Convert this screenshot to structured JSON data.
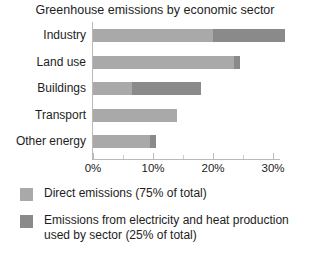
{
  "chart_data": {
    "type": "bar",
    "orientation": "horizontal",
    "stacked": true,
    "title": "Greenhouse emissions by economic sector",
    "xlabel": "",
    "ylabel": "",
    "xlim": [
      0,
      33
    ],
    "grid": false,
    "legend_position": "bottom-left",
    "categories": [
      "Industry",
      "Land use",
      "Buildings",
      "Transport",
      "Other energy"
    ],
    "tick_labels": [
      "0%",
      "10%",
      "20%",
      "30%"
    ],
    "tick_values": [
      0,
      10,
      20,
      30
    ],
    "minor_tick_values": [
      5,
      15,
      25
    ],
    "series": [
      {
        "name": "Direct emissions (75% of total)",
        "color": "#a9a9a9",
        "values": [
          20.0,
          23.5,
          6.5,
          14.0,
          9.5
        ]
      },
      {
        "name": "Emissions from electricity and heat production used by sector (25% of total)",
        "color": "#8a8a8a",
        "values": [
          12.0,
          1.0,
          11.5,
          0.0,
          1.0
        ]
      }
    ],
    "totals": [
      32.0,
      24.5,
      18.0,
      14.0,
      10.5
    ]
  },
  "legend": {
    "items": [
      {
        "label": "Direct emissions (75% of total)",
        "color": "#a9a9a9"
      },
      {
        "label": "Emissions from electricity and heat production used by sector (25% of total)",
        "color": "#8a8a8a"
      }
    ]
  }
}
